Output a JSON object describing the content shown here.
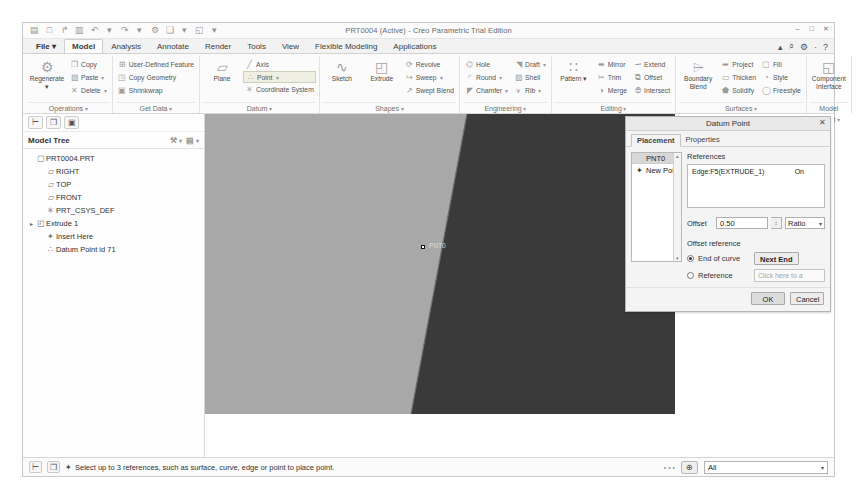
{
  "window": {
    "title": "PRT0004 (Active) - Creo Parametric Trial Edition",
    "minimize": "–",
    "maximize": "□",
    "close": "✕"
  },
  "quick_access": [
    {
      "name": "new-icon",
      "glyph": "▤"
    },
    {
      "name": "open-icon",
      "glyph": "□"
    },
    {
      "name": "save-as-icon",
      "glyph": "↱"
    },
    {
      "name": "save-icon",
      "glyph": "▥"
    },
    {
      "name": "undo-icon",
      "glyph": "↶"
    },
    {
      "name": "undo-dropdown-icon",
      "glyph": "▾"
    },
    {
      "name": "redo-icon",
      "glyph": "↷"
    },
    {
      "name": "redo-dropdown-icon",
      "glyph": "▾"
    },
    {
      "name": "regenerate-icon",
      "glyph": "⚙"
    },
    {
      "name": "repaint-icon",
      "glyph": "❑"
    },
    {
      "name": "repaint-dropdown-icon",
      "glyph": "▾"
    },
    {
      "name": "window-icon",
      "glyph": "◱"
    },
    {
      "name": "qat-overflow-icon",
      "glyph": "▾"
    }
  ],
  "help_bar": [
    {
      "name": "collapse-ribbon-icon",
      "glyph": "▴"
    },
    {
      "name": "search-icon",
      "glyph": "⌕"
    },
    {
      "name": "settings-icon",
      "glyph": "⚙"
    },
    {
      "name": "settings-dropdown-icon",
      "glyph": "·"
    },
    {
      "name": "help-icon",
      "glyph": "?"
    }
  ],
  "tabs": [
    {
      "label": "File",
      "active": false,
      "file": true
    },
    {
      "label": "Model",
      "active": true,
      "file": false
    },
    {
      "label": "Analysis",
      "active": false,
      "file": false
    },
    {
      "label": "Annotate",
      "active": false,
      "file": false
    },
    {
      "label": "Render",
      "active": false,
      "file": false
    },
    {
      "label": "Tools",
      "active": false,
      "file": false
    },
    {
      "label": "View",
      "active": false,
      "file": false
    },
    {
      "label": "Flexible Modeling",
      "active": false,
      "file": false
    },
    {
      "label": "Applications",
      "active": false,
      "file": false
    }
  ],
  "ribbon": {
    "groups": [
      {
        "title": "Operations",
        "big": [
          {
            "label": "Regenerate",
            "glyph": "⚙",
            "dropdown": true
          }
        ],
        "small": [
          {
            "label": "Copy",
            "glyph": "❐",
            "dropdown": false
          },
          {
            "label": "Paste",
            "glyph": "▧",
            "dropdown": true
          },
          {
            "label": "Delete",
            "glyph": "✕",
            "dropdown": true
          }
        ]
      },
      {
        "title": "Get Data",
        "big": [],
        "small": [
          {
            "label": "User-Defined Feature",
            "glyph": "⊞",
            "dropdown": false
          },
          {
            "label": "Copy Geometry",
            "glyph": "◳",
            "dropdown": false
          },
          {
            "label": "Shrinkwrap",
            "glyph": "▣",
            "dropdown": false
          }
        ]
      },
      {
        "title": "Datum",
        "big": [
          {
            "label": "Plane",
            "glyph": "▱",
            "dropdown": false
          }
        ],
        "small": [
          {
            "label": "Axis",
            "glyph": "╱",
            "dropdown": false
          },
          {
            "label": "Point",
            "glyph": "∴",
            "dropdown": true,
            "highlight": true
          },
          {
            "label": "Coordinate System",
            "glyph": "✳",
            "dropdown": false
          }
        ]
      },
      {
        "title": "Shapes",
        "big": [
          {
            "label": "Sketch",
            "glyph": "∿",
            "dropdown": false
          },
          {
            "label": "Extrude",
            "glyph": "◰",
            "dropdown": false
          }
        ],
        "small": [
          {
            "label": "Revolve",
            "glyph": "⟳",
            "dropdown": false
          },
          {
            "label": "Sweep",
            "glyph": "↪",
            "dropdown": true
          },
          {
            "label": "Swept Blend",
            "glyph": "↗",
            "dropdown": false
          }
        ]
      },
      {
        "title": "Engineering",
        "big": [],
        "small": [
          {
            "label": "Hole",
            "glyph": "⌬",
            "dropdown": false
          },
          {
            "label": "Round",
            "glyph": "◜",
            "dropdown": true
          },
          {
            "label": "Chamfer",
            "glyph": "◤",
            "dropdown": true
          }
        ],
        "small2": [
          {
            "label": "Draft",
            "glyph": "◥",
            "dropdown": true
          },
          {
            "label": "Shell",
            "glyph": "▨",
            "dropdown": false
          },
          {
            "label": "Rib",
            "glyph": "⩛",
            "dropdown": true
          }
        ]
      },
      {
        "title": "Editing",
        "big": [
          {
            "label": "Pattern",
            "glyph": "∷",
            "dropdown": true
          }
        ],
        "small": [
          {
            "label": "Mirror",
            "glyph": "⬌",
            "dropdown": false
          },
          {
            "label": "Trim",
            "glyph": "✂",
            "dropdown": false
          },
          {
            "label": "Merge",
            "glyph": "◑",
            "dropdown": false
          }
        ],
        "small2": [
          {
            "label": "Extend",
            "glyph": "⭲",
            "dropdown": false
          },
          {
            "label": "Offset",
            "glyph": "⧉",
            "dropdown": false
          },
          {
            "label": "Intersect",
            "glyph": "⨸",
            "dropdown": false
          }
        ]
      },
      {
        "title": "Surfaces",
        "big": [
          {
            "label": "Boundary Blend",
            "glyph": "⌲",
            "dropdown": false
          }
        ],
        "small": [
          {
            "label": "Project",
            "glyph": "➦",
            "dropdown": false
          },
          {
            "label": "Thicken",
            "glyph": "▭",
            "dropdown": false
          },
          {
            "label": "Solidify",
            "glyph": "⬟",
            "dropdown": false
          }
        ],
        "small2": [
          {
            "label": "Fill",
            "glyph": "▢",
            "dropdown": false
          },
          {
            "label": "Style",
            "glyph": "◔",
            "dropdown": false
          },
          {
            "label": "Freestyle",
            "glyph": "◯",
            "dropdown": false
          }
        ]
      },
      {
        "title": "Model Intent",
        "big": [
          {
            "label": "Component Interface",
            "glyph": "◱",
            "dropdown": false
          }
        ],
        "small": []
      }
    ]
  },
  "tree": {
    "header": "Model Tree",
    "tool_buttons": [
      {
        "name": "show-tree-icon",
        "glyph": "⊢"
      },
      {
        "name": "layers-icon",
        "glyph": "❐"
      },
      {
        "name": "favorites-icon",
        "glyph": "▣"
      }
    ],
    "header_icons": [
      {
        "name": "filter-icon",
        "glyph": "⚒"
      },
      {
        "name": "settings-icon",
        "glyph": "▤"
      }
    ],
    "items": [
      {
        "label": "PRT0004.PRT",
        "icon": "▢",
        "expand": "",
        "indent": 0
      },
      {
        "label": "RIGHT",
        "icon": "▱",
        "expand": "",
        "indent": 1
      },
      {
        "label": "TOP",
        "icon": "▱",
        "expand": "",
        "indent": 1
      },
      {
        "label": "FRONT",
        "icon": "▱",
        "expand": "",
        "indent": 1
      },
      {
        "label": "PRT_CSYS_DEF",
        "icon": "✳",
        "expand": "",
        "indent": 1
      },
      {
        "label": "Extrude 1",
        "icon": "◰",
        "expand": "▸",
        "indent": 0
      },
      {
        "label": "Insert Here",
        "icon": "✦",
        "expand": "",
        "indent": 1
      },
      {
        "label": "Datum Point id 71",
        "icon": "∴",
        "expand": "",
        "indent": 1
      }
    ]
  },
  "viewport": {
    "point_label": "PNT0",
    "side_tools": [
      {
        "name": "drag-point-icon",
        "glyph": "⇱"
      },
      {
        "name": "datum-point-icon",
        "glyph": "⊹"
      }
    ],
    "colors": {
      "light_face": "#a8a8a8",
      "dark_face": "#3a3a3a",
      "background": "#ffffff"
    }
  },
  "dialog": {
    "title": "Datum Point",
    "close": "✕",
    "tabs": [
      {
        "label": "Placement",
        "active": true
      },
      {
        "label": "Properties",
        "active": false
      }
    ],
    "point_list": {
      "selected": "PNT0",
      "new_item": "New Point",
      "new_item_icon": "✦",
      "scroll_up": "▴",
      "scroll_down": "▾"
    },
    "references": {
      "label": "References",
      "rows": [
        {
          "name": "Edge:F5(EXTRUDE_1)",
          "type": "On"
        }
      ]
    },
    "offset": {
      "label": "Offset",
      "value": "0.50",
      "unit": "Ratio",
      "spinner": "↕",
      "chevron": "▾"
    },
    "offset_reference": {
      "label": "Offset reference",
      "options": [
        {
          "label": "End of curve",
          "selected": true
        },
        {
          "label": "Reference",
          "selected": false
        }
      ],
      "next_end_button": "Next End",
      "reference_placeholder": "Click here to a"
    },
    "buttons": {
      "ok": "OK",
      "cancel": "Cancel"
    }
  },
  "statusbar": {
    "left_buttons": [
      {
        "name": "show-tree-icon",
        "glyph": "⊢"
      },
      {
        "name": "layers-icon",
        "glyph": "❐"
      }
    ],
    "message_icon": "✦",
    "message": "Select up to 3 references, such as surface, curve, edge or point to place point.",
    "dots": "• • •",
    "find_button_icon": "⊕",
    "filter": {
      "value": "All",
      "chevron": "▾"
    }
  }
}
